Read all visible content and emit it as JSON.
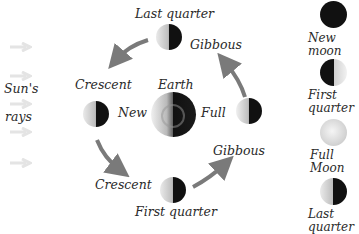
{
  "sun": {
    "label_line1": "Sun's",
    "label_line2": "rays"
  },
  "center": {
    "label": "Earth"
  },
  "orbit_labels": {
    "last_quarter": "Last quarter",
    "gibbous_top": "Gibbous",
    "crescent_left": "Crescent",
    "new": "New",
    "full": "Full",
    "gibbous_bottom": "Gibbous",
    "crescent_bottom": "Crescent",
    "first_quarter": "First quarter"
  },
  "legend": [
    {
      "line1": "New",
      "line2": "moon",
      "phase": "new"
    },
    {
      "line1": "First",
      "line2": "quarter",
      "phase": "first-quarter"
    },
    {
      "line1": "Full",
      "line2": "Moon",
      "phase": "full"
    },
    {
      "line1": "Last",
      "line2": "quarter",
      "phase": "last-quarter"
    }
  ],
  "colors": {
    "dark": "#111111",
    "lit": "#d8d8d8",
    "arrow": "#7a7a7a",
    "text": "#2a2a2a"
  }
}
